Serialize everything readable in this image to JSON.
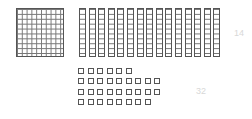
{
  "blocks": {
    "hundreds": 1,
    "tens": 15,
    "unit_rows": [
      6,
      9,
      9,
      8
    ],
    "units_total": 32
  },
  "labels": {
    "tens_label": "14",
    "units_label": "32"
  },
  "colors": {
    "stroke": "#555555",
    "label": "#d8d8d8"
  }
}
